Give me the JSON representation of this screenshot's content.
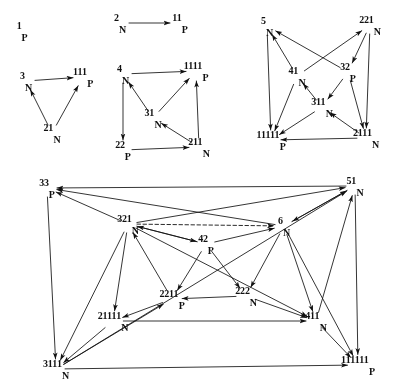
{
  "figure": {
    "title": "",
    "background": "#ffffff",
    "ink_color": "#161616",
    "width": 398,
    "height": 387
  },
  "notation": {
    "description": "Nodes are labelled by a leading digit string, an optional run of tally strokes, and a subscript letter N or P.",
    "subscripts": [
      "N",
      "P"
    ],
    "tally_glyph": "1"
  },
  "graphs": [
    {
      "id": "g1",
      "name": "graph-n1",
      "nodes": [
        {
          "id": "1P",
          "lead": "1",
          "tally": 0,
          "sub": "P",
          "x": 22,
          "y": 30
        }
      ],
      "edges": []
    },
    {
      "id": "g2",
      "name": "graph-n2",
      "nodes": [
        {
          "id": "2N",
          "lead": "2",
          "tally": 0,
          "sub": "N",
          "x": 120,
          "y": 22
        },
        {
          "id": "11P",
          "lead": "",
          "tally": 2,
          "sub": "P",
          "x": 180,
          "y": 22
        }
      ],
      "edges": [
        {
          "from": "2N",
          "to": "11P"
        }
      ]
    },
    {
      "id": "g3",
      "name": "graph-n3",
      "nodes": [
        {
          "id": "3N",
          "lead": "3",
          "tally": 0,
          "sub": "N",
          "x": 26,
          "y": 80
        },
        {
          "id": "111P",
          "lead": "",
          "tally": 3,
          "sub": "P",
          "x": 83,
          "y": 76
        },
        {
          "id": "21N",
          "lead": "2",
          "tally": 1,
          "sub": "N",
          "x": 52,
          "y": 132
        }
      ],
      "edges": [
        {
          "from": "3N",
          "to": "111P"
        },
        {
          "from": "21N",
          "to": "3N"
        },
        {
          "from": "21N",
          "to": "111P"
        }
      ]
    },
    {
      "id": "g4",
      "name": "graph-n4",
      "nodes": [
        {
          "id": "4N",
          "lead": "4",
          "tally": 0,
          "sub": "N",
          "x": 123,
          "y": 73
        },
        {
          "id": "1111P",
          "lead": "",
          "tally": 4,
          "sub": "P",
          "x": 196,
          "y": 70
        },
        {
          "id": "31N",
          "lead": "3",
          "tally": 1,
          "sub": "N",
          "x": 153,
          "y": 117
        },
        {
          "id": "22P",
          "lead": "22",
          "tally": 0,
          "sub": "P",
          "x": 123,
          "y": 149
        },
        {
          "id": "211N",
          "lead": "2",
          "tally": 2,
          "sub": "N",
          "x": 199,
          "y": 146
        }
      ],
      "edges": [
        {
          "from": "4N",
          "to": "1111P"
        },
        {
          "from": "4N",
          "to": "22P"
        },
        {
          "from": "31N",
          "to": "4N"
        },
        {
          "from": "31N",
          "to": "1111P"
        },
        {
          "from": "22P",
          "to": "211N"
        },
        {
          "from": "211N",
          "to": "31N"
        },
        {
          "from": "211N",
          "to": "1111P"
        }
      ]
    },
    {
      "id": "g5",
      "name": "graph-n5",
      "nodes": [
        {
          "id": "5N",
          "lead": "5",
          "tally": 0,
          "sub": "N",
          "x": 267,
          "y": 25
        },
        {
          "id": "221N",
          "lead": "22",
          "tally": 1,
          "sub": "N",
          "x": 370,
          "y": 24
        },
        {
          "id": "41N",
          "lead": "4",
          "tally": 1,
          "sub": "N",
          "x": 297,
          "y": 75
        },
        {
          "id": "32P",
          "lead": "32",
          "tally": 0,
          "sub": "P",
          "x": 348,
          "y": 71
        },
        {
          "id": "311N",
          "lead": "3",
          "tally": 2,
          "sub": "N",
          "x": 322,
          "y": 106
        },
        {
          "id": "11111P",
          "lead": "",
          "tally": 5,
          "sub": "P",
          "x": 271,
          "y": 139
        },
        {
          "id": "2111N",
          "lead": "2",
          "tally": 3,
          "sub": "N",
          "x": 366,
          "y": 137
        }
      ],
      "edges": [
        {
          "from": "41N",
          "to": "5N"
        },
        {
          "from": "32P",
          "to": "5N"
        },
        {
          "from": "41N",
          "to": "221N"
        },
        {
          "from": "221N",
          "to": "32P"
        },
        {
          "from": "32P",
          "to": "311N"
        },
        {
          "from": "311N",
          "to": "41N"
        },
        {
          "from": "41N",
          "to": "11111P"
        },
        {
          "from": "311N",
          "to": "11111P"
        },
        {
          "from": "5N",
          "to": "11111P"
        },
        {
          "from": "221N",
          "to": "2111N"
        },
        {
          "from": "32P",
          "to": "2111N"
        },
        {
          "from": "2111N",
          "to": "311N"
        },
        {
          "from": "2111N",
          "to": "11111P"
        }
      ]
    },
    {
      "id": "g6",
      "name": "graph-n6",
      "nodes": [
        {
          "id": "33P",
          "lead": "33",
          "tally": 0,
          "sub": "P",
          "x": 47,
          "y": 187
        },
        {
          "id": "51N",
          "lead": "5",
          "tally": 1,
          "sub": "N",
          "x": 355,
          "y": 185
        },
        {
          "id": "321N",
          "lead": "32",
          "tally": 1,
          "sub": "N",
          "x": 128,
          "y": 223
        },
        {
          "id": "6N",
          "lead": "6",
          "tally": 0,
          "sub": "N",
          "x": 284,
          "y": 225
        },
        {
          "id": "42P",
          "lead": "42",
          "tally": 0,
          "sub": "P",
          "x": 206,
          "y": 243
        },
        {
          "id": "2211P",
          "lead": "22",
          "tally": 2,
          "sub": "P",
          "x": 172,
          "y": 298
        },
        {
          "id": "222N",
          "lead": "222",
          "tally": 0,
          "sub": "N",
          "x": 246,
          "y": 295
        },
        {
          "id": "21111N",
          "lead": "2",
          "tally": 4,
          "sub": "N",
          "x": 113,
          "y": 320
        },
        {
          "id": "411N",
          "lead": "4",
          "tally": 2,
          "sub": "N",
          "x": 316,
          "y": 320
        },
        {
          "id": "3111N",
          "lead": "3",
          "tally": 3,
          "sub": "N",
          "x": 56,
          "y": 368
        },
        {
          "id": "111111P",
          "lead": "",
          "tally": 6,
          "sub": "P",
          "x": 358,
          "y": 364
        }
      ],
      "edges": [
        {
          "from": "321N",
          "to": "33P"
        },
        {
          "from": "51N",
          "to": "33P"
        },
        {
          "from": "6N",
          "to": "33P"
        },
        {
          "from": "321N",
          "to": "51N"
        },
        {
          "from": "321N",
          "to": "6N",
          "style": "dashed"
        },
        {
          "from": "42P",
          "to": "6N"
        },
        {
          "from": "6N",
          "to": "51N"
        },
        {
          "from": "51N",
          "to": "6N"
        },
        {
          "from": "321N",
          "to": "42P"
        },
        {
          "from": "42P",
          "to": "321N"
        },
        {
          "from": "321N",
          "to": "21111N"
        },
        {
          "from": "321N",
          "to": "3111N"
        },
        {
          "from": "321N",
          "to": "411N"
        },
        {
          "from": "2211P",
          "to": "321N"
        },
        {
          "from": "222N",
          "to": "2211P"
        },
        {
          "from": "42P",
          "to": "222N"
        },
        {
          "from": "42P",
          "to": "2211P"
        },
        {
          "from": "6N",
          "to": "222N"
        },
        {
          "from": "6N",
          "to": "411N"
        },
        {
          "from": "222N",
          "to": "411N"
        },
        {
          "from": "2211P",
          "to": "21111N"
        },
        {
          "from": "21111N",
          "to": "3111N"
        },
        {
          "from": "21111N",
          "to": "411N"
        },
        {
          "from": "3111N",
          "to": "2211P"
        },
        {
          "from": "3111N",
          "to": "111111P"
        },
        {
          "from": "411N",
          "to": "111111P"
        },
        {
          "from": "411N",
          "to": "51N"
        },
        {
          "from": "51N",
          "to": "111111P"
        },
        {
          "from": "33P",
          "to": "3111N"
        },
        {
          "from": "6N",
          "to": "111111P"
        },
        {
          "from": "3111N",
          "to": "51N"
        }
      ]
    }
  ]
}
